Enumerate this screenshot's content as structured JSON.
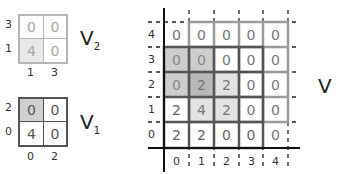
{
  "v2": {
    "name": "V",
    "subscript": "2",
    "y_labels": [
      "3",
      "1"
    ],
    "x_labels": [
      "1",
      "3"
    ],
    "cells": [
      [
        "0",
        "0"
      ],
      [
        "4",
        "0"
      ]
    ],
    "shaded": [
      [
        false,
        false
      ],
      [
        true,
        false
      ]
    ]
  },
  "v1": {
    "name": "V",
    "subscript": "1",
    "y_labels": [
      "2",
      "0"
    ],
    "x_labels": [
      "0",
      "2"
    ],
    "cells": [
      [
        "0",
        "0"
      ],
      [
        "4",
        "0"
      ]
    ],
    "shaded": [
      [
        true,
        false
      ],
      [
        false,
        false
      ]
    ]
  },
  "v": {
    "name": "V",
    "y_labels": [
      "4",
      "3",
      "2",
      "1",
      "0"
    ],
    "x_labels": [
      "0",
      "1",
      "2",
      "3",
      "4"
    ],
    "rows": [
      [
        "0",
        "0",
        "0",
        "0",
        "0"
      ],
      [
        "0",
        "0",
        "0",
        "0",
        "0"
      ],
      [
        "0",
        "2",
        "2",
        "0",
        "0"
      ],
      [
        "2",
        "4",
        "2",
        "0",
        "0"
      ],
      [
        "2",
        "2",
        "0",
        "0",
        "0"
      ]
    ]
  },
  "colors": {
    "shade_mid": "#c9c9c9",
    "shade_dark": "#b3b3b3",
    "shade_light": "#dddddd",
    "outline_dark": "#555555",
    "outline_light": "#999999",
    "text_light": "#9a9a9a",
    "text_dark": "#555555"
  }
}
